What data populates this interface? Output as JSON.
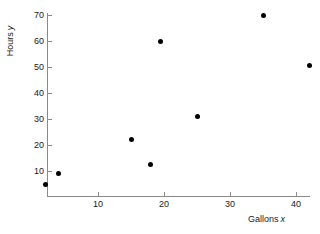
{
  "chart_data": {
    "type": "scatter",
    "title": "",
    "subtitle": "",
    "xlabel": "Gallons",
    "xlabel_variable": "x",
    "ylabel": "Hours",
    "ylabel_variable": "y",
    "xlim": [
      0,
      44.5
    ],
    "ylim": [
      0,
      72.5
    ],
    "grid": false,
    "legend": null,
    "x_ticks": [
      10,
      20,
      30,
      40
    ],
    "y_ticks": [
      10,
      20,
      30,
      40,
      50,
      60,
      70
    ],
    "x_tick_labels": [
      "10",
      "20",
      "30",
      "40"
    ],
    "y_tick_labels": [
      "10",
      "20",
      "30",
      "40",
      "50",
      "60",
      "70"
    ],
    "marker": "filled-circle",
    "marker_color": "#000000",
    "axis_color": "#8a8a8a",
    "background_color": "#ffffff",
    "points": [
      {
        "x": 2.0,
        "y": 5.0
      },
      {
        "x": 4.0,
        "y": 9.0
      },
      {
        "x": 15.0,
        "y": 22.0
      },
      {
        "x": 18.0,
        "y": 12.5
      },
      {
        "x": 19.5,
        "y": 60.0
      },
      {
        "x": 25.0,
        "y": 31.0
      },
      {
        "x": 35.0,
        "y": 70.0
      },
      {
        "x": 42.0,
        "y": 50.5
      }
    ]
  }
}
